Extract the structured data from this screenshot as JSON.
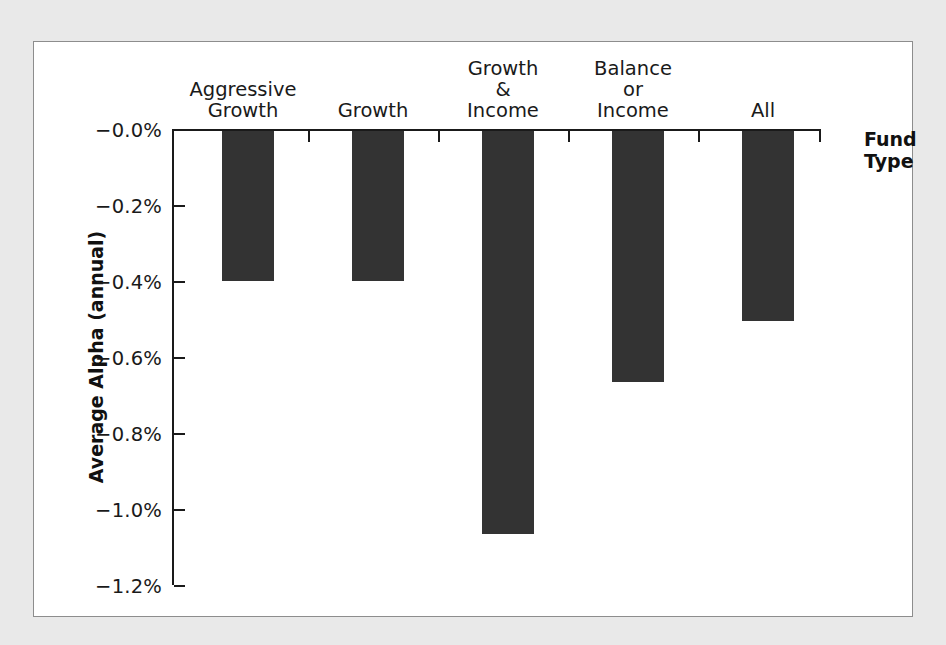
{
  "figure": {
    "background_color": "#e9e9e9",
    "panel_color": "#ffffff",
    "panel_border_color": "#8d8d8d",
    "bar_color": "#333333",
    "axis_color": "#1a1a1a"
  },
  "chart_data": {
    "type": "bar",
    "title": "",
    "subtitle": "",
    "xlabel": "Fund\nType",
    "ylabel": "Average Alpha (annual)",
    "categories": [
      "Aggressive\nGrowth",
      "Growth",
      "Growth &\nIncome",
      "Balance or\nIncome",
      "All"
    ],
    "values": [
      -0.395,
      -0.395,
      -1.06,
      -0.66,
      -0.5
    ],
    "value_unit": "percent",
    "ylim": [
      -1.2,
      0.0
    ],
    "y_tick_values": [
      0.0,
      -0.2,
      -0.4,
      -0.6,
      -0.8,
      -1.0,
      -1.2
    ],
    "y_tick_labels": [
      "−0.0%",
      "−0.2%",
      "−0.4%",
      "−0.6%",
      "−0.8%",
      "−1.0%",
      "−1.2%"
    ],
    "grid": false,
    "legend": false,
    "legend_position": "none",
    "bars_direction": "downward-from-zero-axis",
    "series": [
      {
        "name": "Average Alpha (annual)",
        "values": [
          -0.395,
          -0.395,
          -1.06,
          -0.66,
          -0.5
        ]
      }
    ],
    "annotations": []
  }
}
